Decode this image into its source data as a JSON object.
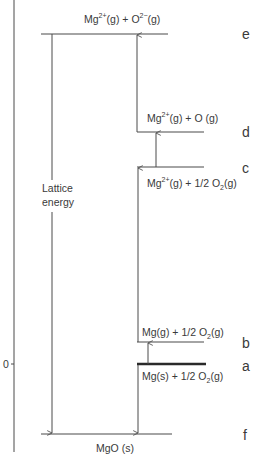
{
  "diagram": {
    "type": "energy-level-diagram",
    "title": "",
    "axis": {
      "zero_label": "0"
    },
    "levels": [
      {
        "id": "e",
        "letter": "e",
        "species": {
          "a": "Mg",
          "a_sup": "2+",
          "b": "(g) + O",
          "b_sup": "2−",
          "c": "(g)"
        }
      },
      {
        "id": "d",
        "letter": "d",
        "species": {
          "a": "Mg",
          "a_sup": "2+",
          "b": "(g) + O (g)"
        }
      },
      {
        "id": "c",
        "letter": "c",
        "species": {
          "a": "Mg",
          "a_sup": "2+",
          "b": "(g) + 1/2 O",
          "b_sub": "2",
          "c": "(g)"
        }
      },
      {
        "id": "b",
        "letter": "b",
        "species": {
          "a": "Mg(g) + 1/2 O",
          "a_sub": "2",
          "b": "(g)"
        }
      },
      {
        "id": "a",
        "letter": "a",
        "species": {
          "a": "Mg(s) + 1/2 O",
          "a_sub": "2",
          "b": "(g)"
        }
      },
      {
        "id": "f",
        "letter": "f",
        "species": {
          "a": "MgO (s)"
        }
      }
    ],
    "lattice_label": {
      "line1": "Lattice",
      "line2": "energy"
    },
    "arrows": [
      {
        "from": "a",
        "to": "b"
      },
      {
        "from": "b",
        "to": "c"
      },
      {
        "from": "c",
        "to": "d"
      },
      {
        "from": "d",
        "to": "e"
      },
      {
        "from": "a",
        "to": "f"
      },
      {
        "from": "e",
        "to": "f",
        "label": "Lattice energy"
      }
    ],
    "colors": {
      "line": "#4a4a4a",
      "text": "#3a3a3a",
      "background": "#ffffff"
    }
  }
}
